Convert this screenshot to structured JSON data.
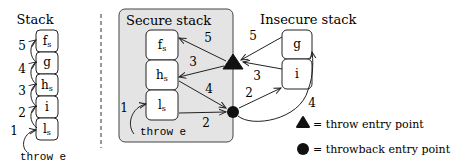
{
  "left_stack": {
    "title": "Stack",
    "frames": [
      "f",
      "g",
      "h",
      "i",
      "l"
    ],
    "frame_subs": [
      "s",
      "",
      "s",
      "",
      "s"
    ],
    "step_labels": [
      "1",
      "2",
      "3",
      "4",
      "5"
    ],
    "throw_label": "throw e"
  },
  "secure_stack": {
    "title": "Secure stack",
    "frames": [
      "f",
      "h",
      "l"
    ],
    "frame_subs": [
      "s",
      "s",
      "s"
    ],
    "throw_label": "throw e",
    "step_labels": {
      "s1": "1",
      "s5": "5",
      "s3": "3",
      "s4": "4",
      "s2": "2"
    }
  },
  "insecure_stack": {
    "title": "Insecure stack",
    "frames": [
      "g",
      "i"
    ],
    "step_labels": {
      "s5": "5",
      "s3": "3",
      "s2": "2",
      "s4": "4"
    }
  },
  "legend": {
    "throw_entry": "= throw entry point",
    "throwback_entry": "= throwback entry point"
  },
  "colors": {
    "secure_bg": "#e4e4e4",
    "stroke": "#222222",
    "frame_fill": "#ffffff"
  }
}
